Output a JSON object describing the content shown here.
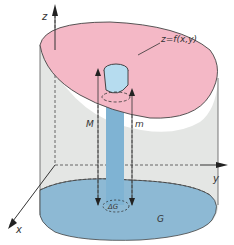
{
  "labels": {
    "z_axis": "z",
    "x_axis": "x",
    "y_axis": "y",
    "surface": "z=f(x,y)",
    "max": "M",
    "min": "m",
    "cell": "ΔG",
    "region": "G"
  },
  "colors": {
    "surface": "#f4b8c6",
    "base": "#8db9d4",
    "wall": "#e4e6e4",
    "column": "#7fb3d3",
    "column_top": "#b6dcef",
    "outline": "#333333"
  }
}
